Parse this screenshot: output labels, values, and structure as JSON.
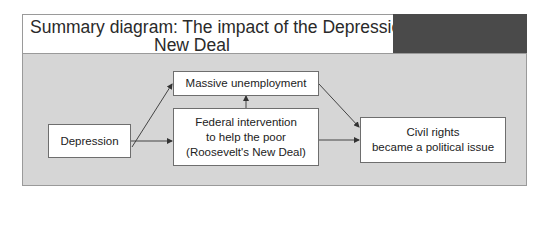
{
  "title": {
    "line1": "Summary diagram: The impact of the Depression and",
    "line2": "New Deal"
  },
  "colors": {
    "panel_bg": "#d6d6d6",
    "title_block": "#4a4a4a",
    "box_bg": "#ffffff",
    "arrow": "#333333"
  },
  "nodes": {
    "depression": "Depression",
    "unemployment": "Massive unemployment",
    "federal": {
      "line1": "Federal intervention",
      "line2": "to help the poor",
      "line3": "(Roosevelt's New Deal)"
    },
    "civil_rights": {
      "line1": "Civil rights",
      "line2": "became a political issue"
    }
  },
  "edges": [
    {
      "from": "Depression",
      "to": "Massive unemployment"
    },
    {
      "from": "Depression",
      "to": "Federal intervention to help the poor (Roosevelt's New Deal)"
    },
    {
      "from": "Federal intervention to help the poor (Roosevelt's New Deal)",
      "to": "Massive unemployment"
    },
    {
      "from": "Massive unemployment",
      "to": "Civil rights became a political issue"
    },
    {
      "from": "Federal intervention to help the poor (Roosevelt's New Deal)",
      "to": "Civil rights became a political issue"
    }
  ]
}
